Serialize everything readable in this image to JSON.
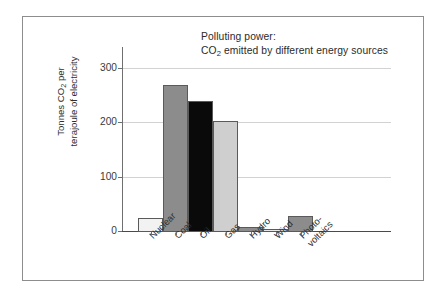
{
  "chart_data": {
    "type": "bar",
    "title": "Polluting power:",
    "subtitle": "CO₂ emitted by different energy sources",
    "title_line1": "Polluting power:",
    "title_line2_pre": "CO",
    "title_line2_sub": "2",
    "title_line2_post": " emitted by different energy sources",
    "xlabel": "",
    "ylabel": "Tonnes CO₂ per terajoule of electricity",
    "ylabel_line1_pre": "Tonnes CO",
    "ylabel_line1_sub": "2",
    "ylabel_line1_post": " per",
    "ylabel_line2": "terajoule of electricity",
    "categories": [
      "Nuclear",
      "Coal",
      "Oil",
      "Gas",
      "Hydro",
      "Wind",
      "Photo-voltaics"
    ],
    "category_labels": [
      {
        "line1": "Nuclear",
        "line2": ""
      },
      {
        "line1": "Coal",
        "line2": ""
      },
      {
        "line1": "Oil",
        "line2": ""
      },
      {
        "line1": "Gas",
        "line2": ""
      },
      {
        "line1": "Hydro",
        "line2": ""
      },
      {
        "line1": "Wind",
        "line2": ""
      },
      {
        "line1": "Photo-",
        "line2": "voltaics"
      }
    ],
    "values": [
      25,
      270,
      242,
      204,
      10,
      5,
      30
    ],
    "bar_colors": [
      "#f2f2f2",
      "#8c8c8c",
      "#0a0a0a",
      "#cfcfcf",
      "#8c8c8c",
      "#e8e8e8",
      "#8c8c8c"
    ],
    "bar_border_color": "#5a5a5a",
    "ylim": [
      0,
      330
    ],
    "yticks": [
      0,
      100,
      200,
      300
    ],
    "ytick_labels": [
      "0",
      "100",
      "200",
      "300"
    ],
    "grid": true,
    "grid_color": "#d2d2d2",
    "legend": "none",
    "legend_position": "none",
    "axis_color": "#4a4a4a",
    "frame_color": "#8d8d8d",
    "background": "#ffffff"
  }
}
